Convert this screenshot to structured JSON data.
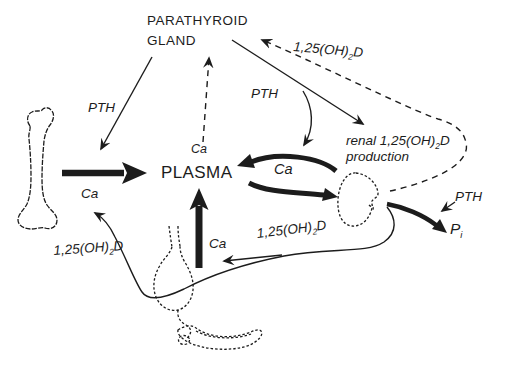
{
  "colors": {
    "ink": "#1c1c1c",
    "paper": "#ffffff"
  },
  "nodes": {
    "parathyroid": {
      "line1": "PARATHYROID",
      "line2": "GLAND"
    },
    "plasma": "PLASMA"
  },
  "labels": {
    "pth": "PTH",
    "ca": "Ca",
    "vitd": {
      "pre": "1,25(OH)",
      "sub": "2",
      "post": "D"
    },
    "renal": {
      "pre": "renal 1,25(OH)",
      "sub": "2",
      "post": "D",
      "line2": "production"
    },
    "pi": {
      "base": "P",
      "sub": "i"
    }
  },
  "figures": {
    "bone": "bone-drawing",
    "kidney": "kidney-drawing",
    "stomach": "stomach-drawing",
    "intestine": "intestine-drawing"
  }
}
